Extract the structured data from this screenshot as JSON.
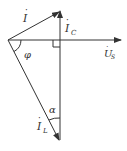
{
  "diagram": {
    "colors": {
      "stroke": "#333333",
      "background": "#ffffff"
    },
    "labels": {
      "I": {
        "main": "I",
        "dot": "·",
        "sub": ""
      },
      "I_C": {
        "main": "I",
        "dot": "·",
        "sub": "C"
      },
      "I_L": {
        "main": "I",
        "dot": "·",
        "sub": "L"
      },
      "U_S": {
        "main": "U",
        "dot": "·",
        "sub": "S"
      },
      "phi": "φ",
      "alpha": "α"
    },
    "vectors": [
      {
        "name": "I",
        "from": [
          8,
          40
        ],
        "to": [
          60,
          12
        ]
      },
      {
        "name": "I_C",
        "from": [
          60,
          40
        ],
        "to": [
          60,
          10
        ]
      },
      {
        "name": "U_S",
        "from": [
          8,
          40
        ],
        "to": [
          121,
          40
        ]
      },
      {
        "name": "I_L",
        "from": [
          8,
          40
        ],
        "to": [
          60,
          140
        ]
      }
    ],
    "right_angle_marker": {
      "at": [
        60,
        40
      ]
    }
  }
}
